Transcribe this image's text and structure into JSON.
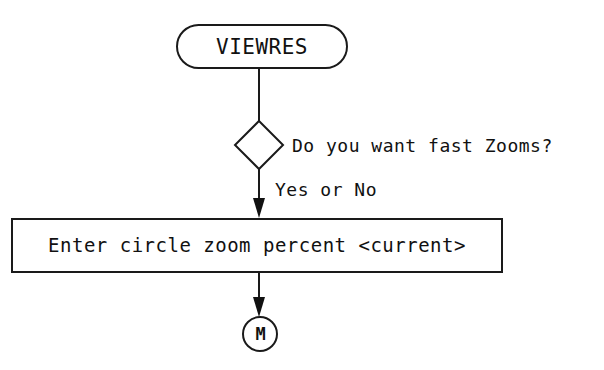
{
  "diagram": {
    "background_color": "#ffffff",
    "stroke_color": "#1a1a1a",
    "text_color": "#111111",
    "nodes": {
      "terminator": {
        "shape": "stadium",
        "label": "VIEWRES"
      },
      "decision": {
        "shape": "diamond",
        "label": "",
        "question": "Do you want fast Zooms?"
      },
      "process": {
        "shape": "rectangle",
        "label": "Enter circle zoom percent <current>"
      },
      "connector": {
        "shape": "circle",
        "label": "M"
      }
    },
    "edges": {
      "terminator_to_decision": {
        "label": "",
        "arrowhead": false
      },
      "decision_to_process": {
        "label": "Yes or No",
        "arrowhead": true
      },
      "process_to_connector": {
        "label": "",
        "arrowhead": true
      }
    }
  }
}
